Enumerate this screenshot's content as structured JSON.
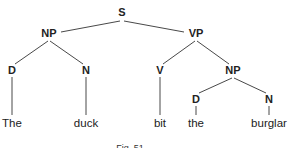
{
  "diagram": {
    "type": "syntax-tree",
    "sentence": "The duck bit the burglar",
    "caption": "Fig. 51",
    "nodes": [
      {
        "id": "S",
        "label": "S",
        "x": 122,
        "y": 16,
        "kind": "category"
      },
      {
        "id": "NP1",
        "label": "NP",
        "x": 49,
        "y": 37,
        "kind": "category"
      },
      {
        "id": "VP",
        "label": "VP",
        "x": 196,
        "y": 37,
        "kind": "category"
      },
      {
        "id": "D1",
        "label": "D",
        "x": 12,
        "y": 74,
        "kind": "category"
      },
      {
        "id": "N1",
        "label": "N",
        "x": 86,
        "y": 74,
        "kind": "category"
      },
      {
        "id": "V",
        "label": "V",
        "x": 160,
        "y": 74,
        "kind": "category"
      },
      {
        "id": "NP2",
        "label": "NP",
        "x": 233,
        "y": 74,
        "kind": "category"
      },
      {
        "id": "D2",
        "label": "D",
        "x": 196,
        "y": 103,
        "kind": "category"
      },
      {
        "id": "N2",
        "label": "N",
        "x": 269,
        "y": 103,
        "kind": "category"
      },
      {
        "id": "w1",
        "label": "The",
        "x": 12,
        "y": 127,
        "kind": "word"
      },
      {
        "id": "w2",
        "label": "duck",
        "x": 86,
        "y": 127,
        "kind": "word"
      },
      {
        "id": "w3",
        "label": "bit",
        "x": 160,
        "y": 127,
        "kind": "word"
      },
      {
        "id": "w4",
        "label": "the",
        "x": 196,
        "y": 127,
        "kind": "word"
      },
      {
        "id": "w5",
        "label": "burglar",
        "x": 269,
        "y": 127,
        "kind": "word"
      }
    ],
    "edges": [
      {
        "from": "S",
        "to": "NP1",
        "x1": 120,
        "y1": 21,
        "x2": 61,
        "y2": 32
      },
      {
        "from": "S",
        "to": "VP",
        "x1": 124,
        "y1": 21,
        "x2": 184,
        "y2": 32
      },
      {
        "from": "NP1",
        "to": "D1",
        "x1": 48,
        "y1": 41,
        "x2": 15,
        "y2": 64
      },
      {
        "from": "NP1",
        "to": "N1",
        "x1": 50,
        "y1": 41,
        "x2": 83,
        "y2": 64
      },
      {
        "from": "VP",
        "to": "V",
        "x1": 195,
        "y1": 41,
        "x2": 163,
        "y2": 64
      },
      {
        "from": "VP",
        "to": "NP2",
        "x1": 197,
        "y1": 41,
        "x2": 229,
        "y2": 64
      },
      {
        "from": "NP2",
        "to": "D2",
        "x1": 232,
        "y1": 78,
        "x2": 199,
        "y2": 93
      },
      {
        "from": "NP2",
        "to": "N2",
        "x1": 234,
        "y1": 78,
        "x2": 266,
        "y2": 93
      },
      {
        "from": "D1",
        "to": "w1",
        "x1": 12,
        "y1": 77,
        "x2": 12,
        "y2": 115
      },
      {
        "from": "N1",
        "to": "w2",
        "x1": 86,
        "y1": 77,
        "x2": 86,
        "y2": 115
      },
      {
        "from": "V",
        "to": "w3",
        "x1": 160,
        "y1": 77,
        "x2": 160,
        "y2": 115
      },
      {
        "from": "D2",
        "to": "w4",
        "x1": 196,
        "y1": 106,
        "x2": 196,
        "y2": 115
      },
      {
        "from": "N2",
        "to": "w5",
        "x1": 269,
        "y1": 106,
        "x2": 269,
        "y2": 115
      }
    ],
    "caption_pos": {
      "x": 130,
      "y": 151
    }
  }
}
